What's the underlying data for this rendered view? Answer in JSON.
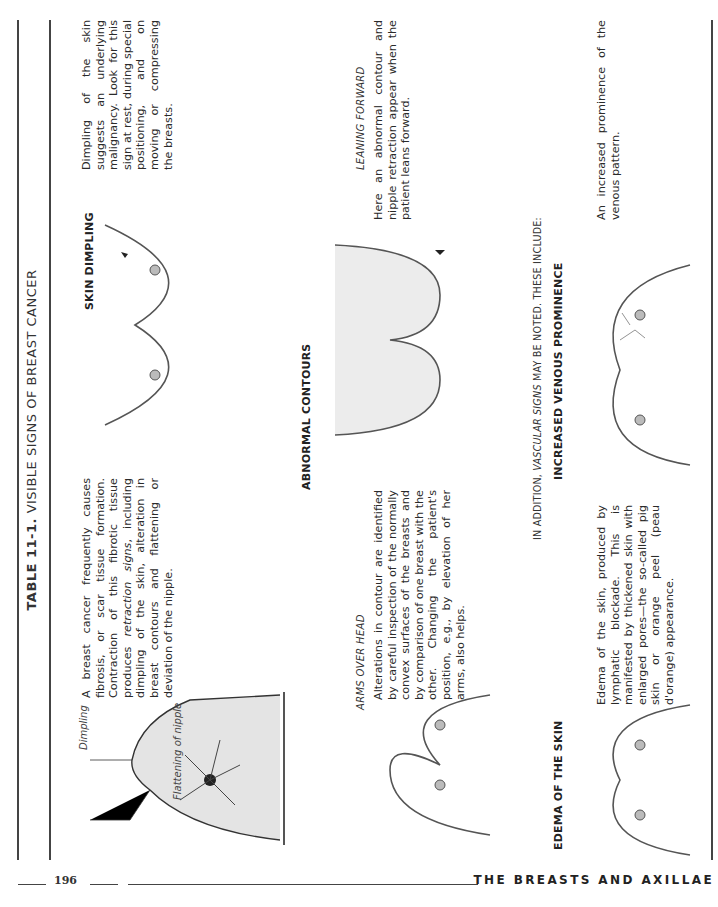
{
  "table": {
    "number": "TABLE 11-1.",
    "title": "VISIBLE SIGNS OF BREAST CANCER"
  },
  "intro": {
    "text_before_italic": "A breast cancer frequently causes fibrosis, or scar tissue formation. Contraction of this fibrotic tissue produces ",
    "italic": "retraction signs",
    "text_after_italic": ", including dimpling of the skin, alteration in breast contours and flattening or deviation of the nipple."
  },
  "diagram": {
    "labels": [
      "Dimpling",
      "Flattening of nipple"
    ]
  },
  "skin_dimpling": {
    "heading": "SKIN DIMPLING",
    "text": "Dimpling of the skin suggests an underlying malignancy. Look for this sign at rest, during special positioning, and on moving or compressing the breasts."
  },
  "abnormal_contours": {
    "heading": "ABNORMAL CONTOURS",
    "arms_over_head": {
      "label": "ARMS OVER HEAD",
      "text": "Alterations in contour are identified by careful inspection of the normally convex surfaces of the breasts and by comparison of one breast with the other. Changing the patient's position, e.g., by elevation of her arms, also helps."
    },
    "leaning_forward": {
      "label": "LEANING FORWARD",
      "text": "Here an abnormal contour and nipple retraction appear when the patient leans forward."
    }
  },
  "vascular_note": {
    "before": "IN ADDITION, ",
    "italic": "VASCULAR SIGNS",
    "after": " MAY BE NOTED. THESE INCLUDE:"
  },
  "edema": {
    "heading": "EDEMA OF THE SKIN",
    "text": "Edema of the skin, produced by lymphatic blockade. This is manifested by thickened skin with enlarged pores—the so-called pig skin or orange peel (peau d'orange) appearance."
  },
  "venous": {
    "heading": "INCREASED VENOUS PROMINENCE",
    "text": "An increased prominence of the venous pattern."
  },
  "footer": {
    "page_number": "196",
    "running_head": "THE BREASTS AND AXILLAE"
  }
}
